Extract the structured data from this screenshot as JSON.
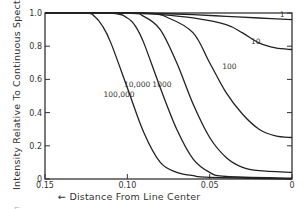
{
  "chart_data": {
    "type": "line",
    "title": "",
    "xlabel": "←  Distance  From  Line Center",
    "ylabel": "Intensity  Relative To  Continuous  Spectrum →",
    "xlim": [
      0.15,
      0
    ],
    "ylim": [
      0,
      1.0
    ],
    "x_reversed": true,
    "grid": false,
    "legend": "inline curve labels",
    "x_ticks": [
      "0.15",
      "0.10",
      "0.05",
      "0"
    ],
    "y_ticks": [
      "0",
      "0.2",
      "0.4",
      "0.6",
      "0.8",
      "1.0"
    ],
    "series": [
      {
        "name": "1",
        "label": "1",
        "x": [
          0.15,
          0.1,
          0.08,
          0.06,
          0.04,
          0.02,
          0.0
        ],
        "y": [
          1.0,
          1.0,
          0.997,
          0.99,
          0.98,
          0.97,
          0.96
        ]
      },
      {
        "name": "10",
        "label": "10",
        "x": [
          0.15,
          0.1,
          0.08,
          0.06,
          0.04,
          0.03,
          0.02,
          0.01,
          0.0
        ],
        "y": [
          1.0,
          1.0,
          0.99,
          0.97,
          0.93,
          0.88,
          0.82,
          0.79,
          0.78
        ]
      },
      {
        "name": "100",
        "label": "100",
        "x": [
          0.15,
          0.09,
          0.075,
          0.06,
          0.05,
          0.04,
          0.03,
          0.02,
          0.01,
          0.0
        ],
        "y": [
          1.0,
          1.0,
          0.97,
          0.88,
          0.7,
          0.52,
          0.39,
          0.3,
          0.26,
          0.25
        ]
      },
      {
        "name": "1000",
        "label": "1000",
        "x": [
          0.15,
          0.1,
          0.09,
          0.08,
          0.07,
          0.06,
          0.05,
          0.04,
          0.03,
          0.02,
          0.0
        ],
        "y": [
          1.0,
          1.0,
          0.98,
          0.9,
          0.7,
          0.45,
          0.25,
          0.13,
          0.07,
          0.05,
          0.04
        ]
      },
      {
        "name": "10,000",
        "label": "10,000",
        "x": [
          0.15,
          0.11,
          0.1,
          0.095,
          0.09,
          0.08,
          0.07,
          0.06,
          0.05,
          0.04,
          0.0
        ],
        "y": [
          1.0,
          1.0,
          0.97,
          0.92,
          0.82,
          0.55,
          0.3,
          0.12,
          0.04,
          0.015,
          0.005
        ]
      },
      {
        "name": "100,000",
        "label": "100,000",
        "x": [
          0.15,
          0.125,
          0.12,
          0.115,
          0.11,
          0.1,
          0.09,
          0.08,
          0.07,
          0.06,
          0.05,
          0.0
        ],
        "y": [
          1.0,
          1.0,
          0.98,
          0.92,
          0.82,
          0.55,
          0.28,
          0.1,
          0.04,
          0.02,
          0.01,
          0.0
        ]
      }
    ],
    "label_positions": {
      "1": [
        0.006,
        0.975
      ],
      "10": [
        0.022,
        0.815
      ],
      "100": [
        0.038,
        0.66
      ],
      "1000": [
        0.079,
        0.555
      ],
      "10,000": [
        0.094,
        0.555
      ],
      "100,000": [
        0.105,
        0.495
      ]
    }
  },
  "caption": "Fig."
}
